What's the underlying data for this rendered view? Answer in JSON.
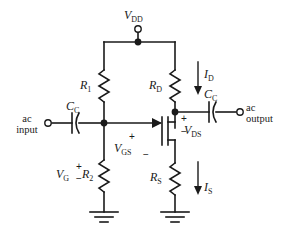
{
  "figure": {
    "kind": "schematic",
    "background_color": "#ffffff",
    "wire_color": "#1a1a1a",
    "text_color": "#1a1a1a"
  },
  "supply": {
    "label_main": "V",
    "label_sub": "DD",
    "terminal": "open-circle"
  },
  "input_port": {
    "line1": "ac",
    "line2": "input",
    "terminal": "open-circle"
  },
  "output_port": {
    "line1": "ac",
    "line2": "output",
    "terminal": "open-circle"
  },
  "components": {
    "r1": {
      "label_main": "R",
      "label_sub": "1",
      "type": "resistor"
    },
    "r2": {
      "label_main": "R",
      "label_sub": "2",
      "type": "resistor"
    },
    "rd": {
      "label_main": "R",
      "label_sub": "D",
      "type": "resistor"
    },
    "rs": {
      "label_main": "R",
      "label_sub": "S",
      "type": "resistor"
    },
    "cc_in": {
      "label_main": "C",
      "label_sub": "C",
      "type": "capacitor"
    },
    "cc_out": {
      "label_main": "C",
      "label_sub": "C",
      "type": "capacitor"
    },
    "transistor": {
      "type": "n-channel-mosfet",
      "terminals": [
        "gate",
        "drain",
        "source"
      ]
    }
  },
  "currents": {
    "id": {
      "label_main": "I",
      "label_sub": "D",
      "direction": "down"
    },
    "is": {
      "label_main": "I",
      "label_sub": "S",
      "direction": "down"
    }
  },
  "voltages": {
    "vg": {
      "label_main": "V",
      "label_sub": "G",
      "plus": "+",
      "minus": "−"
    },
    "vgs": {
      "label_main": "V",
      "label_sub": "GS",
      "plus": "+",
      "minus": "−"
    },
    "vds": {
      "label_main": "V",
      "label_sub": "DS",
      "plus": "+",
      "minus": "−"
    }
  },
  "grounds": [
    {
      "name": "gate-divider-ground"
    },
    {
      "name": "source-ground"
    }
  ]
}
